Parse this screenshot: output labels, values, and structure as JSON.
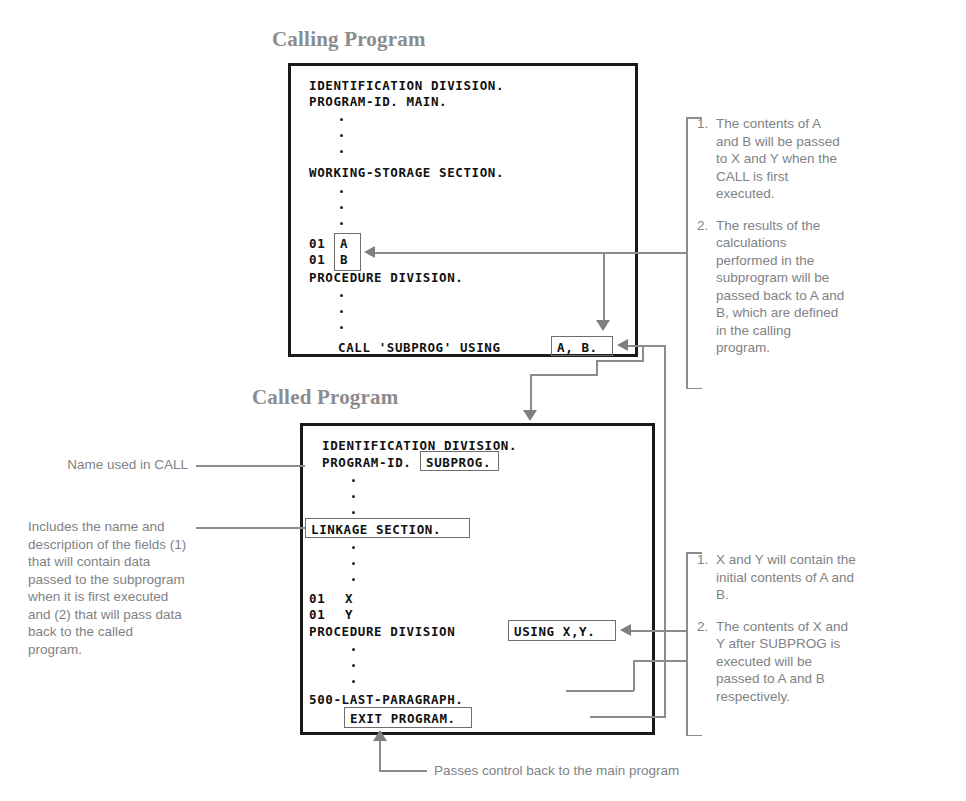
{
  "diagram": {
    "titles": {
      "calling": "Calling Program",
      "called": "Called Program"
    }
  },
  "calling_program": {
    "lines": [
      "IDENTIFICATION DIVISION.",
      "PROGRAM-ID. MAIN.",
      "WORKING-STORAGE SECTION.",
      "01  A",
      "01  B",
      "PROCEDURE DIVISION.",
      "CALL 'SUBPROG' USING"
    ],
    "line1": "IDENTIFICATION DIVISION.",
    "line2": "PROGRAM-ID. MAIN.",
    "line3": "WORKING-STORAGE SECTION.",
    "level_a": "01",
    "var_a": "A",
    "level_b": "01",
    "var_b": "B",
    "procedure_division": "PROCEDURE DIVISION.",
    "call_statement": "CALL 'SUBPROG' USING",
    "call_args": "A, B."
  },
  "called_program": {
    "line1": "IDENTIFICATION DIVISION.",
    "program_id_label": "PROGRAM-ID.",
    "program_id_value": "SUBPROG.",
    "linkage_section": "LINKAGE SECTION.",
    "level_x": "01",
    "var_x": "X",
    "level_y": "01",
    "var_y": "Y",
    "procedure_division": "PROCEDURE DIVISION",
    "using_clause": "USING X,Y.",
    "last_paragraph": "500-LAST-PARAGRAPH.",
    "exit_program": "EXIT PROGRAM."
  },
  "notes_calling": [
    {
      "num": "1.",
      "text": "The contents of A and B will be passed to X and Y when the CALL is first executed."
    },
    {
      "num": "2.",
      "text": "The results of the calculations performed in the subprogram will be passed back to A and B, which are defined in the calling program."
    }
  ],
  "notes_called": [
    {
      "num": "1.",
      "text": "X and Y will contain the initial contents of A and B."
    },
    {
      "num": "2.",
      "text": "The contents of X and Y after SUBPROG is executed will be passed to A and B respectively."
    }
  ],
  "left_notes": {
    "name_used_in_call": "Name used in CALL",
    "linkage_description": "Includes the name and description of the fields (1) that will contain data passed to the subprogram when it is first executed and (2) that will pass data back to the called program."
  },
  "bottom_note": {
    "text": "Passes control back to the main program"
  },
  "colors": {
    "code_text": "#111111",
    "box_border": "#1a1a1a",
    "annotation_text": "#808285",
    "connector_line": "#8a8c8e",
    "highlight_border": "#6e6e6e",
    "background": "#ffffff"
  }
}
